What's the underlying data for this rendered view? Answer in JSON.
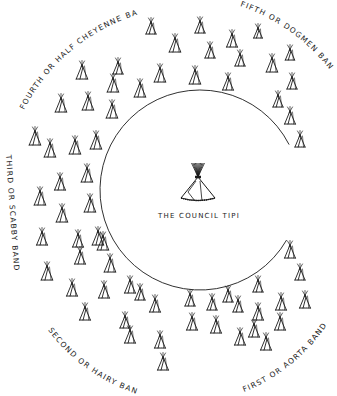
{
  "diagram": {
    "center_label": "The Council Tipi",
    "center_label_display": "THE COUNCIL TIPI",
    "ink_color": "#1a1a1a",
    "background": "#ffffff",
    "circle": {
      "cx": 200,
      "cy": 190,
      "r": 100,
      "open_side": "right",
      "gap_start_deg": -27,
      "gap_end_deg": 30
    },
    "bands": [
      {
        "id": "first",
        "label": "First or Aorta Band",
        "display": "FIRST OR AORTA BAND",
        "position": "bottom-right"
      },
      {
        "id": "second",
        "label": "Second or Hairy Band",
        "display": "SECOND OR HAIRY BAND",
        "position": "bottom-left"
      },
      {
        "id": "third",
        "label": "Third or Scabby Band",
        "display": "THIRD OR SCABBY BAND",
        "position": "left"
      },
      {
        "id": "fourth",
        "label": "Fourth or Half Cheyenne Band",
        "display": "FOURTH OR HALF CHEYENNE BAND",
        "position": "top-left"
      },
      {
        "id": "fifth",
        "label": "Fifth or Dogmen Band",
        "display": "FIFTH OR DOGMEN BAND",
        "position": "top-right"
      }
    ],
    "tipis": [
      [
        151,
        34,
        14
      ],
      [
        175,
        52,
        16
      ],
      [
        200,
        33,
        14
      ],
      [
        232,
        47,
        15
      ],
      [
        210,
        58,
        14
      ],
      [
        258,
        38,
        12
      ],
      [
        240,
        66,
        14
      ],
      [
        272,
        72,
        16
      ],
      [
        290,
        60,
        13
      ],
      [
        292,
        89,
        14
      ],
      [
        278,
        107,
        14
      ],
      [
        290,
        124,
        15
      ],
      [
        300,
        147,
        14
      ],
      [
        195,
        84,
        16
      ],
      [
        160,
        82,
        16
      ],
      [
        228,
        90,
        15
      ],
      [
        140,
        97,
        16
      ],
      [
        118,
        74,
        14
      ],
      [
        82,
        79,
        16
      ],
      [
        113,
        92,
        16
      ],
      [
        61,
        112,
        16
      ],
      [
        88,
        110,
        16
      ],
      [
        112,
        118,
        16
      ],
      [
        35,
        145,
        16
      ],
      [
        50,
        157,
        16
      ],
      [
        75,
        154,
        16
      ],
      [
        96,
        149,
        16
      ],
      [
        87,
        182,
        16
      ],
      [
        60,
        190,
        15
      ],
      [
        40,
        205,
        16
      ],
      [
        62,
        222,
        16
      ],
      [
        90,
        212,
        16
      ],
      [
        42,
        245,
        15
      ],
      [
        78,
        247,
        15
      ],
      [
        98,
        245,
        16
      ],
      [
        47,
        280,
        16
      ],
      [
        80,
        264,
        15
      ],
      [
        103,
        250,
        16
      ],
      [
        110,
        272,
        16
      ],
      [
        72,
        296,
        15
      ],
      [
        85,
        320,
        15
      ],
      [
        104,
        298,
        15
      ],
      [
        130,
        293,
        15
      ],
      [
        140,
        300,
        14
      ],
      [
        125,
        328,
        14
      ],
      [
        130,
        343,
        15
      ],
      [
        155,
        312,
        15
      ],
      [
        160,
        348,
        15
      ],
      [
        163,
        370,
        15
      ],
      [
        192,
        330,
        15
      ],
      [
        190,
        306,
        14
      ],
      [
        212,
        310,
        14
      ],
      [
        228,
        302,
        14
      ],
      [
        240,
        345,
        15
      ],
      [
        216,
        333,
        15
      ],
      [
        254,
        337,
        15
      ],
      [
        258,
        320,
        15
      ],
      [
        266,
        350,
        15
      ],
      [
        258,
        292,
        14
      ],
      [
        281,
        310,
        15
      ],
      [
        290,
        258,
        15
      ],
      [
        300,
        280,
        14
      ],
      [
        305,
        308,
        15
      ],
      [
        280,
        330,
        15
      ],
      [
        238,
        312,
        14
      ]
    ],
    "council_tipi": {
      "x": 198,
      "base": 200,
      "h": 38
    }
  }
}
